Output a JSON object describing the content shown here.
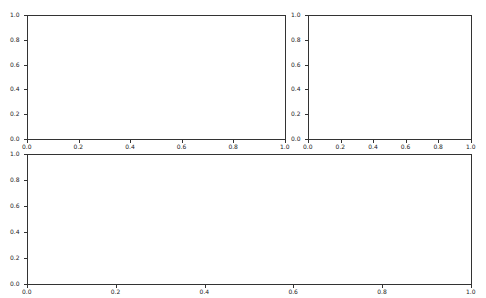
{
  "chart_data": [
    {
      "type": "line",
      "title": "",
      "xlabel": "",
      "ylabel": "",
      "xlim": [
        0.0,
        1.0
      ],
      "ylim": [
        0.0,
        1.0
      ],
      "xticks": [
        "0.0",
        "0.2",
        "0.4",
        "0.6",
        "0.8",
        "1.0"
      ],
      "yticks": [
        "0.0",
        "0.2",
        "0.4",
        "0.6",
        "0.8",
        "1.0"
      ],
      "series": [],
      "grid": false,
      "position": "top-left"
    },
    {
      "type": "line",
      "title": "",
      "xlabel": "",
      "ylabel": "",
      "xlim": [
        0.0,
        1.0
      ],
      "ylim": [
        0.0,
        1.0
      ],
      "xticks": [
        "0.0",
        "0.2",
        "0.4",
        "0.6",
        "0.8",
        "1.0"
      ],
      "yticks": [
        "0.0",
        "0.2",
        "0.4",
        "0.6",
        "0.8",
        "1.0"
      ],
      "series": [],
      "grid": false,
      "position": "top-right"
    },
    {
      "type": "line",
      "title": "",
      "xlabel": "",
      "ylabel": "",
      "xlim": [
        0.0,
        1.0
      ],
      "ylim": [
        0.0,
        1.0
      ],
      "xticks": [
        "0.0",
        "0.2",
        "0.4",
        "0.6",
        "0.8",
        "1.0"
      ],
      "yticks": [
        "0.0",
        "0.2",
        "0.4",
        "0.6",
        "0.8",
        "1.0"
      ],
      "series": [],
      "grid": false,
      "position": "bottom-full-width"
    }
  ],
  "axes": [
    {
      "name": "top-left",
      "left": 27,
      "top": 15,
      "width": 259,
      "height": 125
    },
    {
      "name": "top-right",
      "left": 308,
      "top": 15,
      "width": 164,
      "height": 125
    },
    {
      "name": "bottom",
      "left": 27,
      "top": 154,
      "width": 445,
      "height": 131
    }
  ],
  "tick_labels": [
    "0.0",
    "0.2",
    "0.4",
    "0.6",
    "0.8",
    "1.0"
  ]
}
